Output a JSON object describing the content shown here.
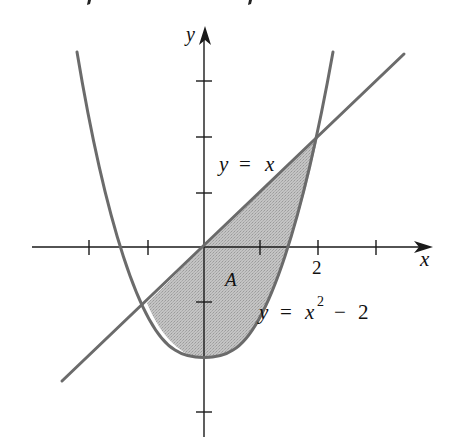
{
  "figure": {
    "type": "region-between-curves",
    "axes": {
      "x_label": "x",
      "y_label": "y",
      "x_ticks": [
        -2,
        -1,
        1,
        2,
        3
      ],
      "y_ticks": [
        3,
        2,
        1,
        -1,
        -2,
        -3
      ],
      "tick_labels": {
        "x_2": "2"
      }
    },
    "curves": [
      {
        "name": "line",
        "equation": "y = x",
        "label_parts": [
          "y",
          " = ",
          "x"
        ]
      },
      {
        "name": "parabola",
        "equation": "y = x^2 - 2",
        "label_parts": [
          "y",
          " = ",
          "x",
          "2",
          " − 2"
        ]
      }
    ],
    "region": {
      "label": "A",
      "bounds": "between y = x and y = x^2 - 2 for -1 ≤ x ≤ 2"
    },
    "intersections": [
      [
        -1,
        -1
      ],
      [
        2,
        2
      ]
    ],
    "colors": {
      "curve": "#6b6b6b",
      "axis": "#1a1a1a",
      "region_fill": "#bdbdbd",
      "background": "#ffffff"
    }
  },
  "labels": {
    "y_axis": "y",
    "x_axis": "x",
    "tick_2": "2",
    "line_y": "y",
    "line_eq": "=",
    "line_x": "x",
    "region": "A",
    "para_y": "y",
    "para_eq": "=",
    "para_x": "x",
    "para_exp": "2",
    "para_minus": "−",
    "para_const": "2"
  }
}
